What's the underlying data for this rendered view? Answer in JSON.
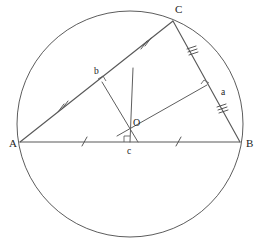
{
  "figure": {
    "background_color": "#ffffff",
    "stroke_color": "#595959",
    "label_color": "#1c1c1c"
  },
  "circle": {
    "name": "circumcircle",
    "cx": 130,
    "cy": 124,
    "r": 113
  },
  "vertices": [
    {
      "id": "A",
      "label": "A",
      "x": 20,
      "y": 142,
      "label_x": 9,
      "label_y": 147
    },
    {
      "id": "B",
      "label": "B",
      "x": 240,
      "y": 142,
      "label_x": 246,
      "label_y": 147
    },
    {
      "id": "C",
      "label": "C",
      "x": 173,
      "y": 21,
      "label_x": 175,
      "label_y": 13
    }
  ],
  "center": {
    "id": "O",
    "label": "O",
    "x": 130,
    "y": 129,
    "label_x": 133,
    "label_y": 126
  },
  "sides": [
    {
      "id": "AB",
      "from": "A",
      "to": "B",
      "tick_count": 1
    },
    {
      "id": "AC",
      "from": "A",
      "to": "C",
      "tick_count": 2
    },
    {
      "id": "BC",
      "from": "B",
      "to": "C",
      "tick_count": 3
    }
  ],
  "feet": [
    {
      "id": "c",
      "label": "c",
      "on_side": "AB",
      "x": 130,
      "y": 142,
      "label_x": 127,
      "label_y": 154,
      "tick_count": 1
    },
    {
      "id": "b",
      "label": "b",
      "on_side": "AC",
      "x": 102,
      "y": 82,
      "label_x": 94,
      "label_y": 74,
      "tick_count": 2
    },
    {
      "id": "a",
      "label": "a",
      "on_side": "BC",
      "x": 207,
      "y": 85,
      "label_x": 221,
      "label_y": 95,
      "tick_count": 3
    }
  ],
  "perpendicular_bisectors": [
    {
      "id": "Oc",
      "label": "perpendicular-bisector-ab",
      "x1": 130,
      "y1": 129,
      "x2": 130,
      "y2": 142
    },
    {
      "id": "Ob",
      "label": "perpendicular-bisector-ac",
      "x1": 130,
      "y1": 129,
      "x2": 102,
      "y2": 82
    },
    {
      "id": "Oa",
      "label": "perpendicular-bisector-bc",
      "x1": 130,
      "y1": 129,
      "x2": 207,
      "y2": 85
    }
  ],
  "extensions": [
    {
      "id": "vertical-through-O",
      "x1": 133,
      "y1": 68,
      "x2": 130,
      "y2": 142
    },
    {
      "id": "Ob-extension",
      "x1": 130,
      "y1": 129,
      "x2": 138,
      "y2": 142
    },
    {
      "id": "Oa-extension",
      "x1": 130,
      "y1": 129,
      "x2": 117,
      "y2": 136
    }
  ],
  "tick_marks": {
    "ab_left": {
      "x": 84,
      "y": 141,
      "count": 1
    },
    "ab_right": {
      "x": 178,
      "y": 141,
      "count": 1
    },
    "ac_lower": {
      "x": 62,
      "y": 108,
      "count": 2
    },
    "ac_upper": {
      "x": 145,
      "y": 45,
      "count": 2
    },
    "bc_upper": {
      "x": 192,
      "y": 50,
      "count": 3
    },
    "bc_lower": {
      "x": 222,
      "y": 108,
      "count": 3
    }
  },
  "right_angle_marks": [
    {
      "at": "c",
      "x": 130,
      "y": 142
    },
    {
      "at": "b",
      "x": 102,
      "y": 82
    },
    {
      "at": "a",
      "x": 207,
      "y": 85
    }
  ],
  "chart_data": {
    "type": "diagram",
    "points": {
      "A": [
        20,
        142
      ],
      "B": [
        240,
        142
      ],
      "C": [
        173,
        21
      ],
      "O": [
        130,
        129
      ],
      "a": [
        207,
        85
      ],
      "b": [
        102,
        82
      ],
      "c": [
        130,
        142
      ]
    },
    "circle": {
      "center": [
        130,
        124
      ],
      "radius": 113
    },
    "equal_mark_groups": [
      {
        "side": "AB",
        "ticks": 1,
        "segments": [
          "Ac",
          "cB"
        ]
      },
      {
        "side": "AC",
        "ticks": 2,
        "segments": [
          "Ab",
          "bC"
        ]
      },
      {
        "side": "BC",
        "ticks": 3,
        "segments": [
          "Ca",
          "aB"
        ]
      }
    ],
    "right_angles_at": [
      "a",
      "b",
      "c"
    ]
  }
}
